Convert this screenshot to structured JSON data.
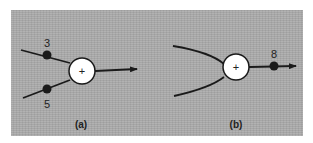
{
  "figure": {
    "background_color": "#a9a9a9",
    "ink_color": "#1a1a1a",
    "node_fill": "#ffffff",
    "panels": [
      {
        "caption": "(a)",
        "node_symbol": "+",
        "inputs": [
          {
            "label": "3",
            "position": "upper"
          },
          {
            "label": "5",
            "position": "lower"
          }
        ],
        "output": {
          "label": ""
        }
      },
      {
        "caption": "(b)",
        "node_symbol": "+",
        "inputs": [
          {
            "label": "",
            "position": "upper"
          },
          {
            "label": "",
            "position": "lower"
          }
        ],
        "output": {
          "label": "8"
        }
      }
    ]
  }
}
